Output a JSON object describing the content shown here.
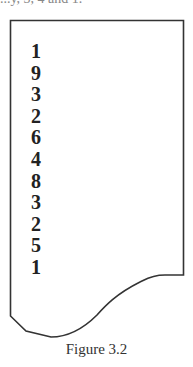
{
  "figure": {
    "top_fragment": "...y, 3, 4 and 1.",
    "digits": [
      "1",
      "9",
      "3",
      "2",
      "6",
      "4",
      "8",
      "3",
      "2",
      "5",
      "1"
    ],
    "caption": "Figure 3.2",
    "stroke_color": "#333333"
  }
}
